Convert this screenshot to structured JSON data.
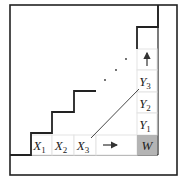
{
  "diagram": {
    "type": "staircase-grid",
    "outer_box": {
      "x": 10,
      "y": 5,
      "width": 167,
      "height": 170,
      "stroke": "#222222"
    },
    "inner_frame_bottom_y": 155,
    "inner_frame_right_x": 157,
    "staircase": {
      "stroke": "#222222",
      "points": [
        [
          10,
          155
        ],
        [
          31,
          155
        ],
        [
          31,
          133
        ],
        [
          52,
          133
        ],
        [
          52,
          112
        ],
        [
          74,
          112
        ],
        [
          74,
          91
        ],
        [
          96,
          91
        ]
      ]
    },
    "upper_staircase": {
      "stroke": "#222222",
      "points": [
        [
          137,
          49
        ],
        [
          137,
          27
        ],
        [
          158,
          27
        ],
        [
          158,
          5
        ]
      ]
    },
    "row_cells": [
      {
        "id": "x1",
        "label": "X",
        "sub": "1",
        "x": 31,
        "y": 135,
        "w": 21,
        "h": 20
      },
      {
        "id": "x2",
        "label": "X",
        "sub": "2",
        "x": 52,
        "y": 135,
        "w": 22,
        "h": 20
      },
      {
        "id": "x3",
        "label": "X",
        "sub": "3",
        "x": 74,
        "y": 135,
        "w": 22,
        "h": 20
      },
      {
        "id": "x-arrow",
        "label": "",
        "sub": "",
        "x": 96,
        "y": 135,
        "w": 41,
        "h": 20
      }
    ],
    "column_cells": [
      {
        "id": "y-arrow",
        "label": "",
        "sub": "",
        "x": 137,
        "y": 49,
        "w": 20,
        "h": 21
      },
      {
        "id": "y3",
        "label": "Y",
        "sub": "3",
        "x": 137,
        "y": 70,
        "w": 20,
        "h": 22
      },
      {
        "id": "y2",
        "label": "Y",
        "sub": "2",
        "x": 137,
        "y": 92,
        "w": 20,
        "h": 21
      },
      {
        "id": "y1",
        "label": "Y",
        "sub": "1",
        "x": 137,
        "y": 113,
        "w": 20,
        "h": 22
      }
    ],
    "corner_cell": {
      "id": "w",
      "label": "W",
      "x": 137,
      "y": 135,
      "w": 20,
      "h": 20,
      "fill": "#b4b4b4"
    },
    "cell_border_color": "#e4e4e4",
    "diagonal_line": {
      "x1": 91,
      "y1": 138,
      "x2": 139,
      "y2": 89,
      "stroke": "#333333"
    },
    "ellipsis_dots": [
      [
        105,
        80
      ],
      [
        116,
        70
      ],
      [
        126,
        59
      ]
    ],
    "arrows": {
      "right": {
        "from": [
          103,
          145
        ],
        "to": [
          117,
          145
        ]
      },
      "up": {
        "from": [
          147,
          66
        ],
        "to": [
          147,
          53
        ]
      }
    }
  }
}
